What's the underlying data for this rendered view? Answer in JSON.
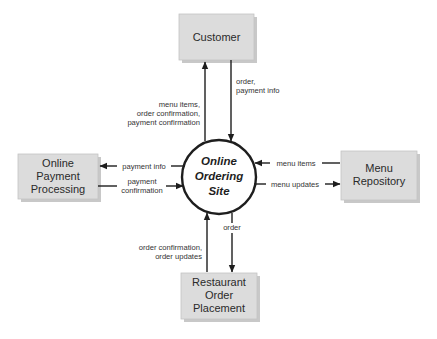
{
  "diagram": {
    "type": "context data flow diagram",
    "colors": {
      "background": "#ffffff",
      "entity_fill": "#dcdcdc",
      "entity_shadow": "#9a9a9a",
      "stroke": "#1e1e1e"
    },
    "process": {
      "lines": [
        "Online",
        "Ordering",
        "Site"
      ]
    },
    "entities": {
      "customer": {
        "lines": [
          "Customer"
        ]
      },
      "payment": {
        "lines": [
          "Online",
          "Payment",
          "Processing"
        ]
      },
      "menu": {
        "lines": [
          "Menu",
          "Repository"
        ]
      },
      "restaurant": {
        "lines": [
          "Restaurant",
          "Order",
          "Placement"
        ]
      }
    },
    "flows": {
      "customer_in": {
        "from": "Online Ordering Site",
        "to": "Customer",
        "lines": [
          "menu items,",
          "order confirmation,",
          "payment confirmation"
        ]
      },
      "customer_out": {
        "from": "Customer",
        "to": "Online Ordering Site",
        "lines": [
          "order,",
          "payment info"
        ]
      },
      "payment_out": {
        "from": "Online Ordering Site",
        "to": "Online Payment Processing",
        "lines": [
          "payment info"
        ]
      },
      "payment_in": {
        "from": "Online Payment Processing",
        "to": "Online Ordering Site",
        "lines": [
          "payment",
          "confirmation"
        ]
      },
      "menu_in": {
        "from": "Menu Repository",
        "to": "Online Ordering Site",
        "lines": [
          "menu items"
        ]
      },
      "menu_out": {
        "from": "Online Ordering Site",
        "to": "Menu Repository",
        "lines": [
          "menu updates"
        ]
      },
      "restaurant_in": {
        "from": "Restaurant Order Placement",
        "to": "Online Ordering Site",
        "lines": [
          "order confirmation,",
          "order updates"
        ]
      },
      "restaurant_out": {
        "from": "Online Ordering Site",
        "to": "Restaurant Order Placement",
        "lines": [
          "order"
        ]
      }
    }
  }
}
